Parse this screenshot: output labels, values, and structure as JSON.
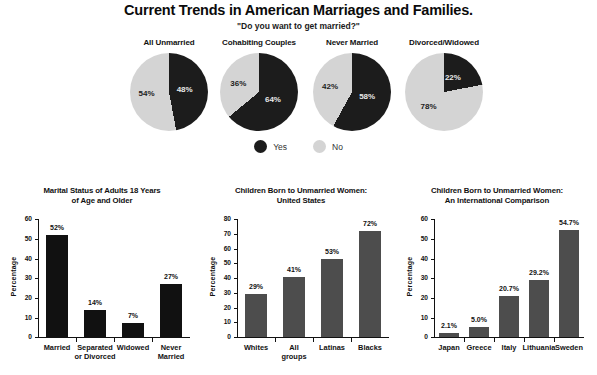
{
  "header": {
    "title": "Current Trends in American Marriages and Families.",
    "subtitle": "\"Do you want to get married?\""
  },
  "colors": {
    "dark": "#1c1c1c",
    "light": "#d4d4d4",
    "bar_dark": "#111111",
    "bar_gray": "#4d4d4d",
    "background": "#ffffff"
  },
  "pies": {
    "legend": [
      {
        "label": "Yes",
        "color": "#1c1c1c",
        "key": "yes"
      },
      {
        "label": "No",
        "color": "#d4d4d4",
        "key": "no"
      }
    ],
    "items": [
      {
        "header": "All Unmarried",
        "yes": 48,
        "no": 54,
        "yes_label": "48%",
        "no_label": "54%"
      },
      {
        "header": "Cohabiting Couples",
        "yes": 64,
        "no": 36,
        "yes_label": "64%",
        "no_label": "36%"
      },
      {
        "header": "Never Married",
        "yes": 58,
        "no": 42,
        "yes_label": "58%",
        "no_label": "42%"
      },
      {
        "header": "Divorced/Widowed",
        "yes": 22,
        "no": 78,
        "yes_label": "22%",
        "no_label": "78%"
      }
    ]
  },
  "chart_data": [
    {
      "type": "bar",
      "id": "marital-status",
      "title": "Marital Status of Adults 18 Years of Age and Older",
      "title_lines": [
        "Marital Status of Adults 18 Years",
        "of Age and Older"
      ],
      "xlabel": "",
      "ylabel": "Percentage",
      "ylim": [
        0,
        60
      ],
      "yticks": [
        0,
        10,
        20,
        30,
        40,
        50,
        60
      ],
      "ytick_labels": [
        "0",
        "10",
        "20",
        "30",
        "40",
        "50",
        "60"
      ],
      "grid": false,
      "legend": "none",
      "bar_color": "#111111",
      "categories": [
        "Married",
        "Separated or Divorced",
        "Widowed",
        "Never Married"
      ],
      "category_lines": [
        [
          "Married"
        ],
        [
          "Separated",
          "or Divorced"
        ],
        [
          "Widowed"
        ],
        [
          "Never",
          "Married"
        ]
      ],
      "values": [
        52,
        14,
        7,
        27
      ],
      "data_labels": [
        "52%",
        "14%",
        "7%",
        "27%"
      ]
    },
    {
      "type": "bar",
      "id": "children-unmarried-us",
      "title": "Children Born to Unmarried Women: United States",
      "title_lines": [
        "Children Born to Unmarried Women:",
        "United States"
      ],
      "xlabel": "",
      "ylabel": "Percentage",
      "ylim": [
        0,
        80
      ],
      "yticks": [
        0,
        10,
        20,
        30,
        40,
        50,
        60,
        70,
        80
      ],
      "ytick_labels": [
        "0",
        "10",
        "20",
        "30",
        "40",
        "50",
        "60",
        "70",
        "80"
      ],
      "grid": false,
      "legend": "none",
      "bar_color": "#4d4d4d",
      "categories": [
        "Whites",
        "All groups",
        "Latinas",
        "Blacks"
      ],
      "category_lines": [
        [
          "Whites"
        ],
        [
          "All",
          "groups"
        ],
        [
          "Latinas"
        ],
        [
          "Blacks"
        ]
      ],
      "values": [
        29,
        41,
        53,
        72
      ],
      "data_labels": [
        "29%",
        "41%",
        "53%",
        "72%"
      ]
    },
    {
      "type": "bar",
      "id": "children-unmarried-international",
      "title": "Children Born to Unmarried Women: An International Comparison",
      "title_lines": [
        "Children Born to Unmarried Women:",
        "An International Comparison"
      ],
      "xlabel": "",
      "ylabel": "Percentage",
      "ylim": [
        0,
        60
      ],
      "yticks": [
        0,
        10,
        20,
        30,
        40,
        50,
        60
      ],
      "ytick_labels": [
        "0",
        "10",
        "20",
        "30",
        "40",
        "50",
        "60"
      ],
      "grid": false,
      "legend": "none",
      "bar_color": "#4d4d4d",
      "categories": [
        "Japan",
        "Greece",
        "Italy",
        "Lithuania",
        "Sweden"
      ],
      "category_lines": [
        [
          "Japan"
        ],
        [
          "Greece"
        ],
        [
          "Italy"
        ],
        [
          "Lithuania"
        ],
        [
          "Sweden"
        ]
      ],
      "values": [
        2.1,
        5.0,
        20.7,
        29.2,
        54.7
      ],
      "data_labels": [
        "2.1%",
        "5.0%",
        "20.7%",
        "29.2%",
        "54.7%"
      ]
    }
  ]
}
